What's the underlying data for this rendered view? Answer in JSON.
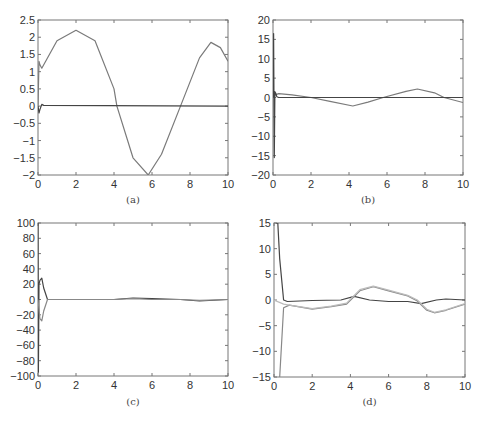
{
  "chart_data": [
    {
      "id": "a",
      "caption": "(a)",
      "type": "line",
      "xlim": [
        0,
        10
      ],
      "ylim": [
        -2,
        2.5
      ],
      "xticks": [
        "0",
        "2",
        "4",
        "6",
        "8",
        "10"
      ],
      "yticks": [
        "-2",
        "-1.5",
        "-1",
        "-0.5",
        "0",
        "0.5",
        "1",
        "1.5",
        "2",
        "2.5"
      ],
      "grid": false,
      "series": [
        {
          "name": "reference",
          "color": "#7a7a7a",
          "x": [
            0,
            0.05,
            0.1,
            0.2,
            1,
            2,
            3,
            4,
            4.15,
            5,
            5.8,
            6.5,
            7.5,
            8.5,
            9.1,
            9.6,
            10
          ],
          "y": [
            0.0,
            1.3,
            1.2,
            1.1,
            1.9,
            2.2,
            1.9,
            0.5,
            0.0,
            -1.5,
            -2.0,
            -1.4,
            0.0,
            1.4,
            1.85,
            1.7,
            1.3
          ]
        },
        {
          "name": "error",
          "color": "#444444",
          "x": [
            0,
            0.05,
            0.1,
            0.2,
            0.3,
            10
          ],
          "y": [
            0.0,
            -0.2,
            -0.1,
            0.05,
            0.02,
            0.0
          ]
        }
      ]
    },
    {
      "id": "b",
      "caption": "(b)",
      "type": "line",
      "xlim": [
        0,
        10
      ],
      "ylim": [
        -20,
        20
      ],
      "xticks": [
        "0",
        "2",
        "4",
        "6",
        "8",
        "10"
      ],
      "yticks": [
        "-20",
        "-15",
        "-10",
        "-5",
        "0",
        "5",
        "10",
        "15",
        "20"
      ],
      "grid": false,
      "series": [
        {
          "name": "signal",
          "color": "#7a7a7a",
          "x": [
            0,
            0.3,
            1,
            2,
            3,
            4.2,
            5,
            5.8,
            7,
            7.6,
            8.5,
            9,
            10
          ],
          "y": [
            0.5,
            1.0,
            0.7,
            0.0,
            -1.0,
            -2.2,
            -1.2,
            0.0,
            1.6,
            2.2,
            1.2,
            0.0,
            -1.3
          ]
        },
        {
          "name": "transient",
          "color": "#444444",
          "x": [
            0,
            0.03,
            0.07,
            0.1,
            0.15,
            0.2,
            0.3,
            10
          ],
          "y": [
            0,
            16.5,
            -15.5,
            1.5,
            1.0,
            0.2,
            0.0,
            0.0
          ]
        }
      ]
    },
    {
      "id": "c",
      "caption": "(c)",
      "type": "line",
      "xlim": [
        0,
        10
      ],
      "ylim": [
        -100,
        100
      ],
      "xticks": [
        "0",
        "2",
        "4",
        "6",
        "8",
        "10"
      ],
      "yticks": [
        "-100",
        "-80",
        "-60",
        "-40",
        "-20",
        "0",
        "20",
        "40",
        "60",
        "80",
        "100"
      ],
      "grid": false,
      "series": [
        {
          "name": "upper",
          "color": "#444444",
          "x": [
            0,
            0.02,
            0.05,
            0.1,
            0.2,
            0.3,
            0.5,
            1,
            4,
            5,
            6,
            7.5,
            8.5,
            10
          ],
          "y": [
            100,
            -95,
            20,
            25,
            28,
            15,
            0,
            0,
            0,
            2,
            1,
            0,
            -2,
            0
          ]
        },
        {
          "name": "lower",
          "color": "#888888",
          "x": [
            0,
            0.1,
            0.2,
            0.3,
            0.5,
            1,
            4,
            5,
            6,
            7.5,
            8.5,
            10
          ],
          "y": [
            0,
            -25,
            -28,
            -15,
            0,
            0,
            0,
            1,
            0,
            0,
            -1,
            0
          ]
        }
      ]
    },
    {
      "id": "d",
      "caption": "(d)",
      "type": "line",
      "xlim": [
        0,
        10
      ],
      "ylim": [
        -15,
        15
      ],
      "xticks": [
        "0",
        "2",
        "4",
        "6",
        "8",
        "10"
      ],
      "yticks": [
        "-15",
        "-10",
        "-5",
        "0",
        "5",
        "10",
        "15"
      ],
      "grid": false,
      "series": [
        {
          "name": "fast",
          "color": "#444444",
          "x": [
            0.1,
            0.2,
            0.3,
            0.5,
            0.7,
            2,
            3.5,
            4.2,
            5,
            6,
            7,
            7.7,
            8.5,
            9,
            10
          ],
          "y": [
            15,
            15,
            8,
            0,
            -0.3,
            -0.1,
            0.0,
            0.7,
            0.0,
            -0.3,
            -0.3,
            -0.7,
            0.0,
            0.2,
            0.0
          ]
        },
        {
          "name": "slow-1",
          "color": "#888888",
          "x": [
            0.3,
            0.5,
            0.8,
            2,
            3,
            3.8,
            4.5,
            5.2,
            6,
            7,
            7.5,
            8,
            8.4,
            9,
            10
          ],
          "y": [
            -15,
            -1.5,
            -1.0,
            -1.8,
            -1.3,
            -0.8,
            1.8,
            2.6,
            1.8,
            0.8,
            -0.2,
            -2.0,
            -2.5,
            -2.0,
            -0.8
          ]
        },
        {
          "name": "slow-2",
          "color": "#bbbbbb",
          "x": [
            0,
            0.5,
            0.8,
            2,
            3,
            3.8,
            4.5,
            5.2,
            6,
            7,
            7.5,
            8,
            8.4,
            9,
            10
          ],
          "y": [
            0.0,
            -0.8,
            -1.0,
            -1.7,
            -1.2,
            -0.6,
            2.0,
            2.7,
            1.9,
            0.9,
            0.0,
            -1.8,
            -2.4,
            -1.9,
            -0.7
          ]
        }
      ]
    }
  ]
}
